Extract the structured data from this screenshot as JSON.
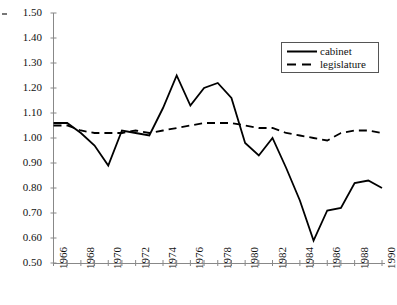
{
  "chart_data": {
    "type": "line",
    "title": "",
    "xlabel": "",
    "ylabel": "",
    "x": [
      1966,
      1967,
      1968,
      1969,
      1970,
      1971,
      1972,
      1973,
      1974,
      1975,
      1976,
      1977,
      1978,
      1979,
      1980,
      1981,
      1982,
      1983,
      1984,
      1985,
      1986,
      1987,
      1988,
      1989,
      1990
    ],
    "xlim": [
      1966,
      1990
    ],
    "ylim": [
      0.5,
      1.5
    ],
    "ytick_labels": [
      "1.50",
      "1.40",
      "1.30",
      "1.20",
      "1.10",
      "1.00",
      "0.90",
      "0.80",
      "0.70",
      "0.60",
      "0.50"
    ],
    "ytick_values": [
      1.5,
      1.4,
      1.3,
      1.2,
      1.1,
      1.0,
      0.9,
      0.8,
      0.7,
      0.6,
      0.5
    ],
    "xtick_labels": [
      "1966",
      "1968",
      "1970",
      "1972",
      "1974",
      "1976",
      "1978",
      "1980",
      "1982",
      "1984",
      "1986",
      "1988",
      "1990"
    ],
    "xtick_values": [
      1966,
      1968,
      1970,
      1972,
      1974,
      1976,
      1978,
      1980,
      1982,
      1984,
      1986,
      1988,
      1990
    ],
    "minor_xticks_every": 1,
    "grid": false,
    "legend_position": "upper right",
    "series": [
      {
        "name": "cabinet",
        "style": "solid",
        "color": "#000000",
        "values": [
          1.06,
          1.06,
          1.02,
          0.97,
          0.89,
          1.03,
          1.02,
          1.01,
          1.12,
          1.25,
          1.13,
          1.2,
          1.22,
          1.16,
          0.98,
          0.93,
          1.0,
          0.88,
          0.75,
          0.59,
          0.71,
          0.72,
          0.82,
          0.83,
          0.8
        ]
      },
      {
        "name": "legislature",
        "style": "dashed",
        "color": "#000000",
        "values": [
          1.05,
          1.05,
          1.03,
          1.02,
          1.02,
          1.02,
          1.03,
          1.02,
          1.03,
          1.04,
          1.05,
          1.06,
          1.06,
          1.06,
          1.05,
          1.04,
          1.04,
          1.02,
          1.01,
          1.0,
          0.99,
          1.02,
          1.03,
          1.03,
          1.02
        ]
      }
    ]
  },
  "legend": {
    "items": [
      {
        "label": "cabinet",
        "style": "solid"
      },
      {
        "label": "legislature",
        "style": "dashed"
      }
    ]
  }
}
